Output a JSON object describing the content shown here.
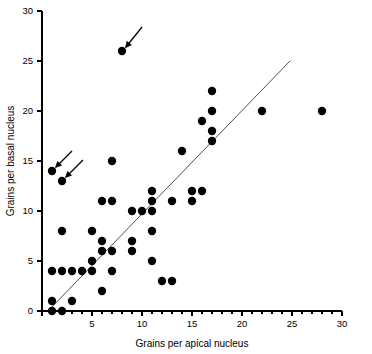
{
  "figure": {
    "background_color": "#ffffff",
    "point_color": "#000000",
    "line_color": "#3b3b3b"
  },
  "chart_data": {
    "type": "scatter",
    "title": "",
    "xlabel": "Grains per apical nucleus",
    "ylabel": "Grains per basal nucleus",
    "xlim": [
      0,
      30
    ],
    "ylim": [
      0,
      30
    ],
    "xticks": [
      0,
      5,
      10,
      15,
      20,
      25,
      30
    ],
    "xtick_labels": [
      "",
      "5",
      "10",
      "15",
      "20",
      "25",
      "30"
    ],
    "yticks": [
      0,
      5,
      10,
      15,
      20,
      25,
      30
    ],
    "ytick_labels": [
      "0",
      "5",
      "10",
      "15",
      "20",
      "25",
      "30"
    ],
    "xtick_minor": [
      1,
      2,
      3,
      4,
      6,
      7,
      8,
      9,
      11,
      12,
      13,
      14,
      16,
      17,
      18,
      19,
      21,
      22,
      23,
      24,
      26,
      27,
      28,
      29
    ],
    "grid": false,
    "legend": null,
    "marker": "filled-circle",
    "marker_size_px": 4.2,
    "points": [
      {
        "x": 1,
        "y": 0
      },
      {
        "x": 2,
        "y": 0
      },
      {
        "x": 1,
        "y": 1
      },
      {
        "x": 3,
        "y": 1
      },
      {
        "x": 6,
        "y": 2
      },
      {
        "x": 12,
        "y": 3
      },
      {
        "x": 13,
        "y": 3
      },
      {
        "x": 1,
        "y": 4
      },
      {
        "x": 2,
        "y": 4
      },
      {
        "x": 3,
        "y": 4
      },
      {
        "x": 4,
        "y": 4
      },
      {
        "x": 5,
        "y": 4
      },
      {
        "x": 7,
        "y": 4
      },
      {
        "x": 5,
        "y": 5
      },
      {
        "x": 11,
        "y": 5
      },
      {
        "x": 6,
        "y": 6
      },
      {
        "x": 7,
        "y": 6
      },
      {
        "x": 9,
        "y": 6
      },
      {
        "x": 6,
        "y": 7
      },
      {
        "x": 9,
        "y": 7
      },
      {
        "x": 2,
        "y": 8
      },
      {
        "x": 5,
        "y": 8
      },
      {
        "x": 11,
        "y": 8
      },
      {
        "x": 9,
        "y": 10
      },
      {
        "x": 10,
        "y": 10
      },
      {
        "x": 11,
        "y": 10
      },
      {
        "x": 6,
        "y": 11
      },
      {
        "x": 7,
        "y": 11
      },
      {
        "x": 11,
        "y": 11
      },
      {
        "x": 13,
        "y": 11
      },
      {
        "x": 15,
        "y": 11
      },
      {
        "x": 11,
        "y": 12
      },
      {
        "x": 15,
        "y": 12
      },
      {
        "x": 16,
        "y": 12
      },
      {
        "x": 2,
        "y": 13
      },
      {
        "x": 1,
        "y": 14
      },
      {
        "x": 7,
        "y": 15
      },
      {
        "x": 14,
        "y": 16
      },
      {
        "x": 17,
        "y": 17
      },
      {
        "x": 17,
        "y": 18
      },
      {
        "x": 16,
        "y": 19
      },
      {
        "x": 17,
        "y": 20
      },
      {
        "x": 22,
        "y": 20
      },
      {
        "x": 28,
        "y": 20
      },
      {
        "x": 17,
        "y": 22
      },
      {
        "x": 8,
        "y": 26
      }
    ],
    "fit_line": {
      "x0": 0.6,
      "y0": 0.0,
      "x1": 24.8,
      "y1": 25.0
    },
    "annotations": [
      {
        "name": "arrow-outlier-high",
        "target_x": 8,
        "target_y": 26,
        "tail_dx": 2.0,
        "tail_dy": 2.4
      },
      {
        "name": "arrow-outlier-left-upper",
        "target_x": 1,
        "target_y": 14,
        "tail_dx": 2.0,
        "tail_dy": 2.0
      },
      {
        "name": "arrow-outlier-left-lower",
        "target_x": 2,
        "target_y": 13,
        "tail_dx": 2.1,
        "tail_dy": 2.1
      }
    ]
  }
}
